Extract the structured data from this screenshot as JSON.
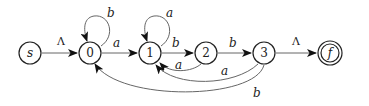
{
  "diagram": {
    "type": "finite-automaton",
    "stroke_color": "#222222",
    "edge_color": "#555555",
    "states": [
      {
        "id": "s",
        "label": "s",
        "italic": true,
        "accepting": false,
        "x": 30,
        "y": 53
      },
      {
        "id": "0",
        "label": "0",
        "italic": false,
        "accepting": false,
        "x": 90,
        "y": 53
      },
      {
        "id": "1",
        "label": "1",
        "italic": false,
        "accepting": false,
        "x": 150,
        "y": 53
      },
      {
        "id": "2",
        "label": "2",
        "italic": false,
        "accepting": false,
        "x": 206,
        "y": 53
      },
      {
        "id": "3",
        "label": "3",
        "italic": false,
        "accepting": false,
        "x": 264,
        "y": 53
      },
      {
        "id": "f",
        "label": "f",
        "italic": true,
        "accepting": true,
        "x": 330,
        "y": 53
      }
    ],
    "transitions": [
      {
        "from": "s",
        "to": "0",
        "label": "Λ"
      },
      {
        "from": "0",
        "to": "0",
        "label": "b"
      },
      {
        "from": "0",
        "to": "1",
        "label": "a"
      },
      {
        "from": "1",
        "to": "1",
        "label": "a"
      },
      {
        "from": "1",
        "to": "2",
        "label": "b"
      },
      {
        "from": "2",
        "to": "1",
        "label": "a"
      },
      {
        "from": "2",
        "to": "3",
        "label": "b"
      },
      {
        "from": "3",
        "to": "1",
        "label": "a"
      },
      {
        "from": "3",
        "to": "0",
        "label": "b"
      },
      {
        "from": "3",
        "to": "f",
        "label": "Λ"
      }
    ]
  }
}
